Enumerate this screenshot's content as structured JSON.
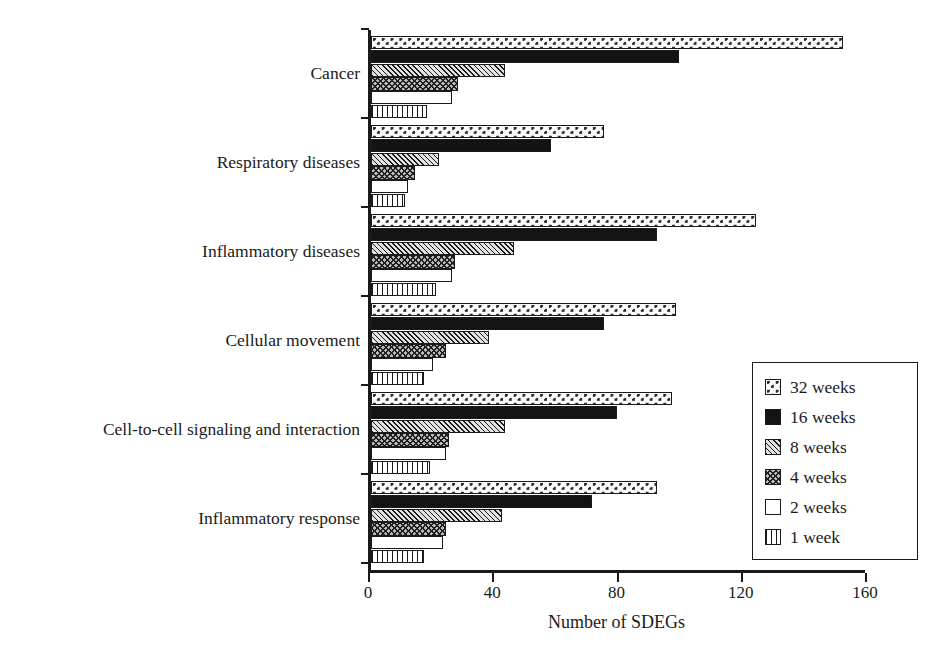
{
  "chart_data": {
    "type": "bar",
    "orientation": "horizontal",
    "title": "",
    "xlabel": "Number of SDEGs",
    "ylabel": "",
    "xlim": [
      0,
      160
    ],
    "xticks": [
      0,
      40,
      80,
      120,
      160
    ],
    "xtick_labels": [
      "0",
      "40",
      "80",
      "120",
      "160"
    ],
    "grid": false,
    "legend_position": "right-inside",
    "categories": [
      "Cancer",
      "Respiratory diseases",
      "Inflammatory diseases",
      "Cellular movement",
      "Cell-to-cell signaling and interaction",
      "Inflammatory response"
    ],
    "series": [
      {
        "name": "32 weeks",
        "pattern": "dotted-checker",
        "values": [
          153,
          76,
          125,
          99,
          98,
          93
        ]
      },
      {
        "name": "16 weeks",
        "pattern": "solid-black",
        "values": [
          100,
          59,
          93,
          76,
          80,
          72
        ]
      },
      {
        "name": "8 weeks",
        "pattern": "diagonal-hatch",
        "values": [
          44,
          23,
          47,
          39,
          44,
          43
        ]
      },
      {
        "name": "4 weeks",
        "pattern": "cross-hatch",
        "values": [
          29,
          15,
          28,
          25,
          26,
          25
        ]
      },
      {
        "name": "2 weeks",
        "pattern": "open-white",
        "values": [
          27,
          13,
          27,
          21,
          25,
          24
        ]
      },
      {
        "name": "1 week",
        "pattern": "vertical-lines",
        "values": [
          19,
          12,
          22,
          18,
          20,
          18
        ]
      }
    ]
  },
  "axis": {
    "x_title": "Number of SDEGs",
    "tick_labels": [
      "0",
      "40",
      "80",
      "120",
      "160"
    ]
  },
  "legend": {
    "items": [
      {
        "label": "32 weeks"
      },
      {
        "label": "16 weeks"
      },
      {
        "label": "8 weeks"
      },
      {
        "label": "4 weeks"
      },
      {
        "label": "2 weeks"
      },
      {
        "label": "1 week"
      }
    ]
  },
  "colors": {
    "axis": "#1a1a1a",
    "background": "#ffffff",
    "bar_outline": "#1a1a1a",
    "solid_fill": "#131313"
  }
}
